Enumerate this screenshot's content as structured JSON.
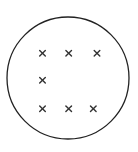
{
  "diagram": {
    "circle": {
      "cx": 68,
      "cy": 78,
      "r": 61,
      "stroke": "#222222"
    },
    "marks": [
      {
        "x": 42.5,
        "y": 53.3,
        "symbol": "cross"
      },
      {
        "x": 68.7,
        "y": 53.3,
        "symbol": "cross"
      },
      {
        "x": 97,
        "y": 53.3,
        "symbol": "cross"
      },
      {
        "x": 42.5,
        "y": 80.3,
        "symbol": "cross"
      },
      {
        "x": 42.5,
        "y": 108.7,
        "symbol": "cross"
      },
      {
        "x": 68.7,
        "y": 108.7,
        "symbol": "cross"
      },
      {
        "x": 93.3,
        "y": 108.7,
        "symbol": "cross"
      }
    ],
    "mark_color": "#333333"
  }
}
